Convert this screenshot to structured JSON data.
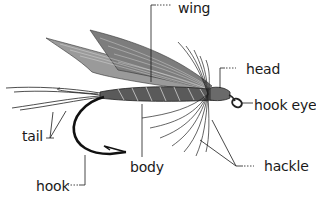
{
  "diagram": {
    "labels": {
      "wing": "wing",
      "head": "head",
      "hook_eye": "hook eye",
      "tail": "tail",
      "body": "body",
      "hackle": "hackle",
      "hook": "hook"
    },
    "colors": {
      "ink": "#1a1a1a",
      "background": "#ffffff",
      "wing_fill": "#8a8a8a",
      "body_fill": "#555555"
    }
  }
}
